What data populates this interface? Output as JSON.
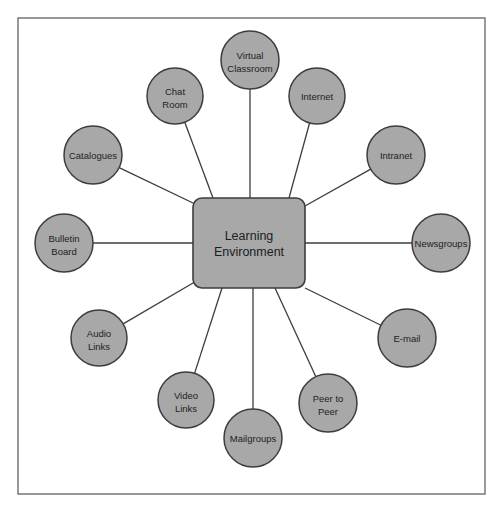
{
  "diagram": {
    "title": "Learning Environment",
    "type": "hub-and-spoke",
    "frame": {
      "x": 18,
      "y": 18,
      "width": 467,
      "height": 476,
      "stroke_color": "#6e6e6e",
      "fill_color": "#ffffff"
    },
    "style": {
      "node_fill": "#a8a8a8",
      "node_stroke": "#3d3d3d",
      "connector_stroke": "#3d3d3d",
      "text_color": "#222222",
      "page_background": "#ffffff"
    },
    "hub": {
      "label_line1": "Learning",
      "label_line2": "Environment",
      "x": 193,
      "y": 198,
      "width": 112,
      "height": 90,
      "corner_radius": 9
    },
    "nodes": [
      {
        "id": "virtual-classroom",
        "label_line1": "Virtual",
        "label_line2": "Classroom",
        "cx": 250,
        "cy": 60,
        "r": 29,
        "anchor_x": 250,
        "anchor_y": 198
      },
      {
        "id": "internet",
        "label_line1": "Internet",
        "label_line2": "",
        "cx": 317,
        "cy": 96,
        "r": 28,
        "anchor_x": 289,
        "anchor_y": 198
      },
      {
        "id": "intranet",
        "label_line1": "Intranet",
        "label_line2": "",
        "cx": 396,
        "cy": 155,
        "r": 29,
        "anchor_x": 305,
        "anchor_y": 206
      },
      {
        "id": "newsgroups",
        "label_line1": "Newsgroups",
        "label_line2": "",
        "cx": 441,
        "cy": 243,
        "r": 29,
        "anchor_x": 305,
        "anchor_y": 243
      },
      {
        "id": "e-mail",
        "label_line1": "E-mail",
        "label_line2": "",
        "cx": 407,
        "cy": 338,
        "r": 29,
        "anchor_x": 305,
        "anchor_y": 288
      },
      {
        "id": "peer-to-peer",
        "label_line1": "Peer to",
        "label_line2": "Peer",
        "cx": 328,
        "cy": 403,
        "r": 29,
        "anchor_x": 275,
        "anchor_y": 288
      },
      {
        "id": "mailgroups",
        "label_line1": "Mailgroups",
        "label_line2": "",
        "cx": 253,
        "cy": 438,
        "r": 29,
        "anchor_x": 253,
        "anchor_y": 288
      },
      {
        "id": "video-links",
        "label_line1": "Video",
        "label_line2": "Links",
        "cx": 186,
        "cy": 400,
        "r": 28,
        "anchor_x": 222,
        "anchor_y": 288
      },
      {
        "id": "audio-links",
        "label_line1": "Audio",
        "label_line2": "Links",
        "cx": 99,
        "cy": 338,
        "r": 28,
        "anchor_x": 193,
        "anchor_y": 283
      },
      {
        "id": "bulletin-board",
        "label_line1": "Bulletin",
        "label_line2": "Board",
        "cx": 64,
        "cy": 243,
        "r": 29,
        "anchor_x": 193,
        "anchor_y": 243
      },
      {
        "id": "catalogues",
        "label_line1": "Catalogues",
        "label_line2": "",
        "cx": 93,
        "cy": 155,
        "r": 29,
        "anchor_x": 193,
        "anchor_y": 203
      },
      {
        "id": "chat-room",
        "label_line1": "Chat",
        "label_line2": "Room",
        "cx": 175,
        "cy": 96,
        "r": 28,
        "anchor_x": 213,
        "anchor_y": 198
      }
    ]
  }
}
